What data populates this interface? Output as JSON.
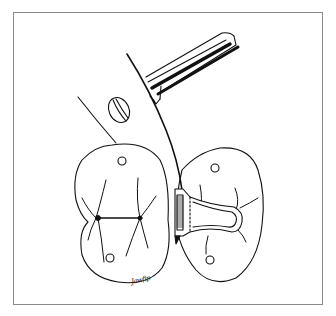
{
  "figure": {
    "colors": {
      "background": "#ffffff",
      "line": "#111111",
      "frame": "#8a8a8a"
    },
    "elements": [
      {
        "name": "left-molar",
        "description": "occlusal view of molar with fissure lines and contact point marker"
      },
      {
        "name": "right-molar",
        "description": "occlusal view of molar with matrix band retainer"
      },
      {
        "name": "matrix-band",
        "description": "band with serrated edge contoured around proximal surface"
      },
      {
        "name": "instrument-handle",
        "description": "cylindrical handle with grooved shaft"
      },
      {
        "name": "curved-blade",
        "description": "curved wedge/blade inserted interproximally"
      },
      {
        "name": "oval-screw",
        "description": "oval screw/knob on blade"
      }
    ],
    "signature": "Jawfip"
  }
}
